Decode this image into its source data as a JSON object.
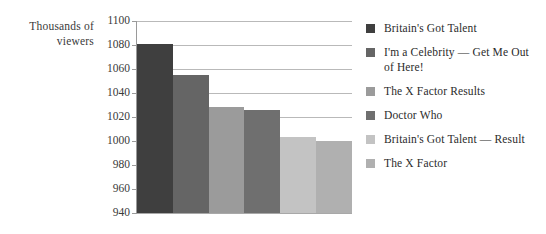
{
  "axis_title": "Thousands of\nviewers",
  "axis_title_line1": "Thousands of",
  "axis_title_line2": "viewers",
  "chart_data": {
    "type": "bar",
    "title": "",
    "xlabel": "",
    "ylabel": "Thousands of viewers",
    "ylim": [
      940,
      1100
    ],
    "ytick_step": 20,
    "ytick_labels": [
      "1100",
      "1080",
      "1060",
      "1040",
      "1020",
      "1000",
      "980",
      "960",
      "940"
    ],
    "grid": true,
    "legend_position": "right",
    "categories": [
      "Britain's Got Talent",
      "I'm a Celebrity — Get Me Out of Here!",
      "The X Factor Results",
      "Doctor Who",
      "Britain's Got Talent — Result",
      "The X Factor"
    ],
    "values": [
      1081,
      1055,
      1028,
      1026,
      1003,
      1000
    ],
    "colors": [
      "#3f3f3f",
      "#656565",
      "#9b9b9b",
      "#6f6f6f",
      "#c3c3c3",
      "#b0b0b0"
    ]
  },
  "legend": {
    "items": [
      {
        "label": "Britain's Got Talent",
        "color": "#3f3f3f"
      },
      {
        "label": "I'm a Celebrity — Get Me Out of Here!",
        "color": "#656565"
      },
      {
        "label": "The X Factor Results",
        "color": "#9b9b9b"
      },
      {
        "label": "Doctor Who",
        "color": "#6f6f6f"
      },
      {
        "label": "Britain's Got Talent — Result",
        "color": "#c3c3c3"
      },
      {
        "label": "The X Factor",
        "color": "#b0b0b0"
      }
    ]
  }
}
